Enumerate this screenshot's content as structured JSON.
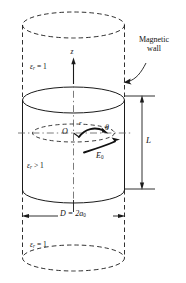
{
  "figure": {
    "type": "cylindrical-dielectric-resonator-diagram",
    "background": "#ffffff",
    "line_color": "#1a1a1a",
    "text_color": "#111111"
  },
  "labels": {
    "magnetic_wall": "Magnetic",
    "magnetic_wall_2": "wall",
    "eps_top_symbol": "ε",
    "eps_top_sub": "r",
    "eps_top_rel": " = 1",
    "eps_mid_symbol": "ε",
    "eps_mid_sub": "r",
    "eps_mid_rel": " > 1",
    "eps_bot_symbol": "ε",
    "eps_bot_sub": "r",
    "eps_bot_rel": " = 1",
    "z_axis": "z",
    "origin": "O",
    "radius": "r",
    "theta": "θ",
    "e_field": "E",
    "e_field_sub": "0",
    "height": "L",
    "diameter": "D = 2a",
    "diameter_sub": "0"
  },
  "geometry": {
    "cx": 73.5,
    "rx": 51,
    "ry": 13,
    "top_dashed_y": 25,
    "solid_top_y": 100,
    "solid_bottom_y": 190,
    "bottom_dashed_y": 258,
    "inner_ellipse_y": 133,
    "inner_rx": 41,
    "inner_ry": 9,
    "L_arrow_x": 142,
    "L_top_y": 96,
    "L_bottom_y": 189,
    "D_arrow_y": 216
  }
}
